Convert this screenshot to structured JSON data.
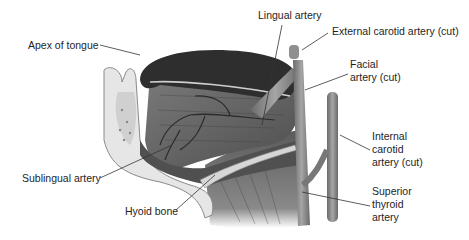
{
  "diagram": {
    "labels": [
      {
        "id": "apex-of-tongue",
        "lines": [
          "Apex of tongue"
        ]
      },
      {
        "id": "lingual-artery",
        "lines": [
          "Lingual artery"
        ]
      },
      {
        "id": "external-carotid-artery",
        "lines": [
          "External carotid artery (cut)"
        ]
      },
      {
        "id": "facial-artery",
        "lines": [
          "Facial",
          "artery (cut)"
        ]
      },
      {
        "id": "internal-carotid-artery",
        "lines": [
          "Internal",
          "carotid",
          "artery (cut)"
        ]
      },
      {
        "id": "sublingual-artery",
        "lines": [
          "Sublingual artery"
        ]
      },
      {
        "id": "superior-thyroid-artery",
        "lines": [
          "Superior",
          "thyroid",
          "artery"
        ]
      },
      {
        "id": "hyoid-bone",
        "lines": [
          "Hyoid bone"
        ]
      }
    ],
    "colors": {
      "tongue_dorsum": "#2f2f2f",
      "muscle": "#6e6e6e",
      "muscle_dark": "#4a4a4a",
      "bone": "#d9d9d9",
      "artery": "#8a8a8a",
      "leader_line": "#333333",
      "label_text": "#1e1e1e"
    }
  }
}
